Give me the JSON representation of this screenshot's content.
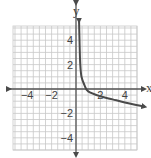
{
  "chart_data": {
    "type": "line",
    "title": "",
    "xlabel": "x",
    "ylabel": "y",
    "xlim": [
      -5,
      5
    ],
    "ylim": [
      -5,
      5
    ],
    "grid": true,
    "grid_minor_step": 0.5,
    "x_ticks": [
      {
        "value": -4,
        "label": "−4"
      },
      {
        "value": -2,
        "label": "−2"
      },
      {
        "value": 2,
        "label": "2"
      },
      {
        "value": 4,
        "label": "4"
      }
    ],
    "y_ticks": [
      {
        "value": 4,
        "label": "4"
      },
      {
        "value": 2,
        "label": "2"
      },
      {
        "value": -2,
        "label": "−2"
      },
      {
        "value": -4,
        "label": "−4"
      }
    ],
    "series": [
      {
        "name": "curve",
        "description": "decreasing curve with vertical asymptote at x = 0, crossing x-axis near x ≈ 0.8",
        "points": [
          [
            0.25,
            5.6
          ],
          [
            0.3,
            3.5
          ],
          [
            0.35,
            2.0
          ],
          [
            0.45,
            1.0
          ],
          [
            0.7,
            0.3
          ],
          [
            1.0,
            -0.2
          ],
          [
            2.0,
            -0.6
          ],
          [
            3.0,
            -0.85
          ],
          [
            4.0,
            -1.1
          ],
          [
            5.6,
            -1.45
          ]
        ],
        "arrows": [
          "start",
          "end"
        ]
      }
    ],
    "legend": null
  },
  "colors": {
    "grid": "#c8c8c8",
    "axis": "#555555",
    "curve": "#4a4a4a",
    "background": "#ffffff"
  }
}
